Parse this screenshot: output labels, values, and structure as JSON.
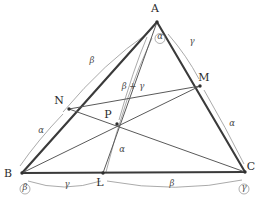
{
  "figure": {
    "vertices": [
      {
        "name": "A",
        "label": "A",
        "x": 157,
        "y": 22,
        "label_x": 155,
        "label_y": 12
      },
      {
        "name": "B",
        "label": "B",
        "x": 22,
        "y": 173,
        "label_x": 8,
        "label_y": 177
      },
      {
        "name": "C",
        "label": "C",
        "x": 245,
        "y": 172,
        "label_x": 251,
        "label_y": 170
      }
    ],
    "points": [
      {
        "name": "N",
        "label": "N",
        "x": 69,
        "y": 109,
        "label_x": 59,
        "label_y": 104
      },
      {
        "name": "M",
        "label": "M",
        "x": 200,
        "y": 86,
        "label_x": 204,
        "label_y": 81
      },
      {
        "name": "L",
        "label": "L",
        "x": 103,
        "y": 173,
        "label_x": 100,
        "label_y": 186
      },
      {
        "name": "P",
        "label": "P",
        "x": 117,
        "y": 124,
        "label_x": 108,
        "label_y": 118
      }
    ],
    "sides": [
      {
        "name": "side-AB",
        "from": "A",
        "to": "B"
      },
      {
        "name": "side-AC",
        "from": "A",
        "to": "C"
      },
      {
        "name": "side-BC",
        "from": "B",
        "to": "C"
      }
    ],
    "cevians": [
      {
        "name": "cevian-AL",
        "from": "A",
        "to": "L"
      },
      {
        "name": "cevian-BM",
        "from": "B",
        "to": "M"
      },
      {
        "name": "cevian-CN",
        "from": "C",
        "to": "N"
      },
      {
        "name": "segment-NM",
        "from": "N",
        "to": "M"
      }
    ],
    "angle_labels": [
      {
        "name": "angle-at-A",
        "text": "α",
        "x": 160,
        "y": 39,
        "boxed": true
      },
      {
        "name": "angle-at-B",
        "text": "β",
        "x": 25,
        "y": 190,
        "boxed": true
      },
      {
        "name": "angle-at-C",
        "text": "γ",
        "x": 244,
        "y": 190,
        "boxed": true
      },
      {
        "name": "arc-label-AN-beta",
        "text": "β",
        "x": 92,
        "y": 63,
        "boxed": false
      },
      {
        "name": "arc-label-BN-alpha",
        "text": "α",
        "x": 41,
        "y": 133,
        "boxed": false
      },
      {
        "name": "arc-label-AM-gamma",
        "text": "γ",
        "x": 192,
        "y": 44,
        "boxed": false
      },
      {
        "name": "arc-label-MC-alpha",
        "text": "α",
        "x": 232,
        "y": 126,
        "boxed": false
      },
      {
        "name": "arc-label-BL-gamma",
        "text": "γ",
        "x": 67,
        "y": 187,
        "boxed": false
      },
      {
        "name": "arc-label-LC-beta",
        "text": "β",
        "x": 172,
        "y": 186,
        "boxed": false
      },
      {
        "name": "angle-at-P-alpha",
        "text": "α",
        "x": 122,
        "y": 152,
        "boxed": false
      },
      {
        "name": "angle-sum-beta-gamma",
        "text": "β + γ",
        "x": 133,
        "y": 89,
        "boxed": false
      }
    ],
    "arcs": [
      {
        "name": "arc-A-to-N",
        "d": "M 148 33 Q 105 62 63 112"
      },
      {
        "name": "arc-N-to-B",
        "d": "M 63 114 Q 38 140 20 166"
      },
      {
        "name": "arc-A-to-M",
        "d": "M 168 34 Q 187 56 199 79"
      },
      {
        "name": "arc-M-to-C",
        "d": "M 204 90 Q 226 128 244 164"
      },
      {
        "name": "arc-B-to-L",
        "d": "M 28 181 Q 64 193 101 181"
      },
      {
        "name": "arc-L-to-C",
        "d": "M 107 181 Q 176 194 242 180"
      },
      {
        "name": "arc-P-sum",
        "d": "M 147 37 Q 133 70 119 120"
      },
      {
        "name": "arc-P-alpha",
        "d": "M 152 38 Q 125 95 106 172"
      }
    ],
    "angle_rings": [
      {
        "name": "ring-at-A",
        "cx": 160,
        "cy": 38.5,
        "rx": 5.0,
        "ry": 5.0
      },
      {
        "name": "ring-at-B",
        "cx": 25,
        "cy": 189,
        "rx": 5.0,
        "ry": 5.0
      },
      {
        "name": "ring-at-C",
        "cx": 244,
        "cy": 189,
        "rx": 5.0,
        "ry": 5.0
      }
    ]
  }
}
